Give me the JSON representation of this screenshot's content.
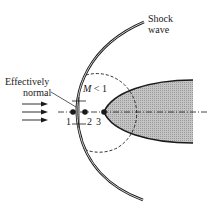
{
  "diagram": {
    "labels": {
      "shock_line1": "Shock",
      "shock_line2": "wave",
      "effectively_line1": "Effectively",
      "effectively_line2": "normal",
      "mach_M": "M",
      "mach_rest": " < 1",
      "point1": "1",
      "point2": "2",
      "point3": "3"
    },
    "colors": {
      "line": "#1a1a1a",
      "body_fill": "#b8b8b8",
      "background": "#ffffff"
    }
  }
}
